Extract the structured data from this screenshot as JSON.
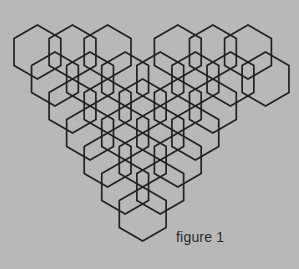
{
  "figure": {
    "caption": "figure 1",
    "background_color": "#b8b8b8",
    "stroke_color": "#222222",
    "fill_color": "none",
    "stroke_width": 1.7,
    "shape_name": "hexagon",
    "orientation": "flat-top",
    "total_hexagons": 25
  },
  "geometry": {
    "hex_side": 27,
    "hex_width": 46.8,
    "hex_height": 54,
    "column_step": 35.1,
    "row_step": 27,
    "origin_x": 14,
    "origin_y": 25
  },
  "chart_data": {
    "type": "diagram",
    "title": "figure 1",
    "rows": [
      {
        "index": 1,
        "count": 6,
        "columns": [
          0,
          1,
          2,
          4,
          5,
          6
        ],
        "row_offset_cols": 0,
        "y_center": 52
      },
      {
        "index": 2,
        "count": 7,
        "columns": [
          0,
          1,
          2,
          3,
          4,
          5,
          6
        ],
        "row_offset_cols": 0.5,
        "y_center": 79
      },
      {
        "index": 3,
        "count": 5,
        "columns": [
          1,
          2,
          3,
          4,
          5
        ],
        "row_offset_cols": 0,
        "y_center": 106
      },
      {
        "index": 4,
        "count": 4,
        "columns": [
          1,
          2,
          3,
          4
        ],
        "row_offset_cols": 0.5,
        "y_center": 133
      },
      {
        "index": 5,
        "count": 3,
        "columns": [
          2,
          3,
          4
        ],
        "row_offset_cols": 0,
        "y_center": 160
      },
      {
        "index": 6,
        "count": 2,
        "columns": [
          2,
          3
        ],
        "row_offset_cols": 0.5,
        "y_center": 187
      },
      {
        "index": 7,
        "count": 1,
        "columns": [
          3
        ],
        "row_offset_cols": 0,
        "y_center": 214
      }
    ],
    "row_counts": [
      6,
      7,
      5,
      4,
      3,
      2,
      1
    ],
    "notch": {
      "row": 1,
      "missing_column": 3
    }
  }
}
